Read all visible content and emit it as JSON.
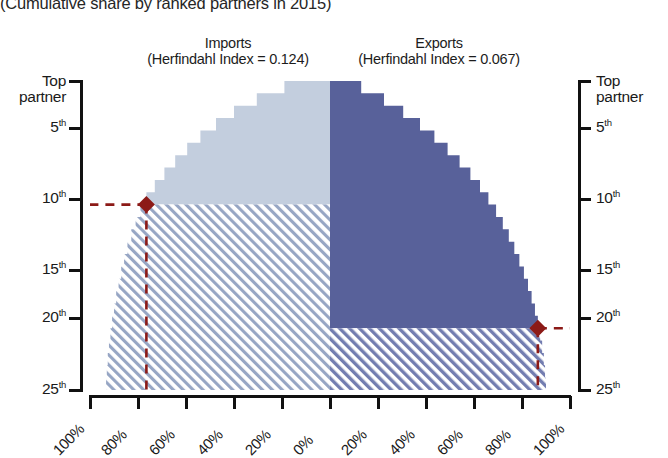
{
  "subtitle": "(Cumulative share by ranked partners in 2015)",
  "panels": {
    "imports": {
      "title": "Imports",
      "index_label": "(Herfindahl Index = 0.124)"
    },
    "exports": {
      "title": "Exports",
      "index_label": "(Herfindahl Index = 0.067)"
    }
  },
  "axes": {
    "y_left_title": "Top\npartner",
    "y_right_title": "Top\npartner",
    "y_ticks": [
      {
        "label": "Top partner",
        "value": 1
      },
      {
        "label": "5",
        "sup": "th",
        "value": 5
      },
      {
        "label": "10",
        "sup": "th",
        "value": 10
      },
      {
        "label": "15",
        "sup": "th",
        "value": 15
      },
      {
        "label": "20",
        "sup": "th",
        "value": 20
      },
      {
        "label": "25",
        "sup": "th",
        "value": 25
      }
    ],
    "x_ticks": [
      "100%",
      "80%",
      "60%",
      "40%",
      "20%",
      "0%",
      "20%",
      "40%",
      "60%",
      "80%",
      "100%"
    ]
  },
  "colors": {
    "imports_fill": "#c3cede",
    "imports_hatch": "#7d8fb3",
    "exports_fill": "#58619a",
    "exports_hatch": "#6b74a6",
    "marker": "#8c1a17",
    "axis": "#111111"
  },
  "annotations": {
    "imports_marker": {
      "rank": 10,
      "share_pct": 80,
      "label": "10th partner ~80%"
    },
    "exports_marker": {
      "rank": 20,
      "share_pct": 80,
      "label": "20th partner ~80%"
    }
  },
  "chart_data": {
    "type": "area",
    "subtitle": "(Cumulative share by ranked partners in 2015)",
    "xlabel": "",
    "ylabel": "Partner rank",
    "orientation": "horizontal-mirrored",
    "grid": false,
    "legend": "none",
    "xlim_left": [
      100,
      0
    ],
    "xlim_right": [
      0,
      100
    ],
    "ylim": [
      1,
      25
    ],
    "y_categories": [
      1,
      2,
      3,
      4,
      5,
      6,
      7,
      8,
      9,
      10,
      11,
      12,
      13,
      14,
      15,
      16,
      17,
      18,
      19,
      20,
      21,
      22,
      23,
      24,
      25
    ],
    "series": [
      {
        "name": "Imports",
        "herfindahl_index": 0.124,
        "direction": "left",
        "cumulative_share_pct": [
          19.0,
          30.5,
          40.0,
          47.5,
          54.0,
          59.5,
          64.5,
          69.0,
          73.0,
          76.5,
          79.0,
          81.0,
          82.8,
          84.4,
          85.8,
          87.0,
          88.1,
          89.1,
          90.0,
          90.8,
          91.5,
          92.1,
          92.6,
          93.0,
          93.3
        ],
        "highlight_rank": 10,
        "highlight_share_pct": 76.5
      },
      {
        "name": "Exports",
        "herfindahl_index": 0.067,
        "direction": "right",
        "cumulative_share_pct": [
          13.0,
          22.5,
          30.5,
          37.5,
          43.5,
          49.0,
          54.0,
          58.5,
          62.5,
          66.0,
          69.2,
          72.0,
          74.5,
          76.8,
          78.9,
          80.8,
          82.5,
          84.0,
          85.4,
          86.6,
          87.6,
          88.4,
          89.1,
          89.6,
          90.0
        ],
        "highlight_rank": 20,
        "highlight_share_pct": 86.6
      }
    ]
  }
}
